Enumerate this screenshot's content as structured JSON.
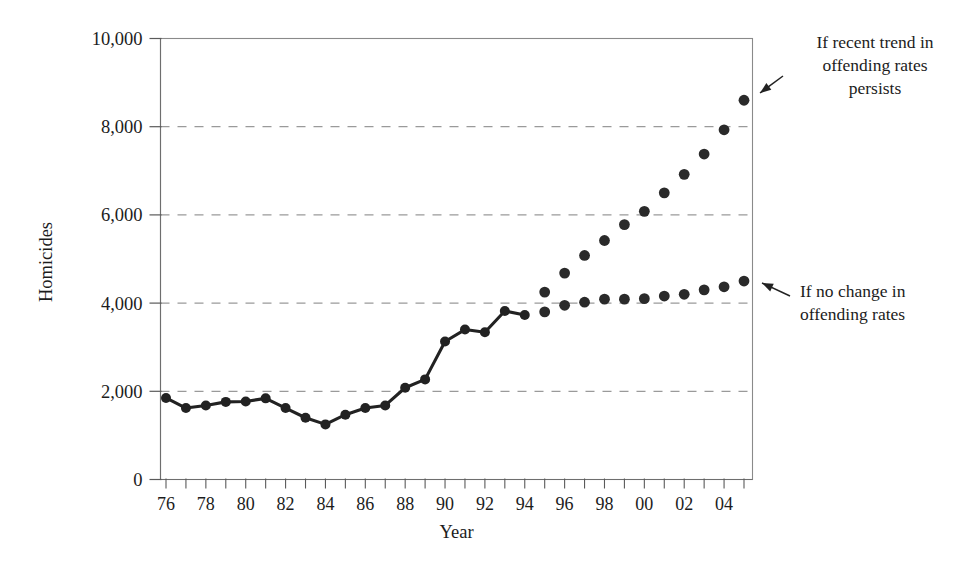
{
  "chart_data": {
    "type": "scatter",
    "title": "",
    "xlabel": "Year",
    "ylabel": "Homicides",
    "xlim": [
      1976,
      2005
    ],
    "ylim": [
      0,
      10000
    ],
    "grid": true,
    "legend_position": "none",
    "y_ticks": [
      0,
      2000,
      4000,
      6000,
      8000,
      10000
    ],
    "y_tick_labels": [
      "0",
      "2,000",
      "4,000",
      "6,000",
      "8,000",
      "10,000"
    ],
    "x_ticks": [
      1976,
      1977,
      1978,
      1979,
      1980,
      1981,
      1982,
      1983,
      1984,
      1985,
      1986,
      1987,
      1988,
      1989,
      1990,
      1991,
      1992,
      1993,
      1994,
      1995,
      1996,
      1997,
      1998,
      1999,
      2000,
      2001,
      2002,
      2003,
      2004,
      2005
    ],
    "x_tick_labels": [
      "76",
      "",
      "78",
      "",
      "80",
      "",
      "82",
      "",
      "84",
      "",
      "86",
      "",
      "88",
      "",
      "90",
      "",
      "92",
      "",
      "94",
      "",
      "96",
      "",
      "98",
      "",
      "00",
      "",
      "02",
      "",
      "04",
      ""
    ],
    "series": [
      {
        "name": "Historical homicides",
        "style": "line-with-markers",
        "x": [
          1976,
          1977,
          1978,
          1979,
          1980,
          1981,
          1982,
          1983,
          1984,
          1985,
          1986,
          1987,
          1988,
          1989,
          1990,
          1991,
          1992,
          1993,
          1994
        ],
        "values": [
          1850,
          1620,
          1680,
          1760,
          1770,
          1840,
          1620,
          1400,
          1250,
          1470,
          1620,
          1680,
          2080,
          2270,
          3130,
          3400,
          3340,
          3820,
          3730
        ]
      },
      {
        "name": "If recent trend in offending rates persists",
        "style": "markers",
        "x": [
          1995,
          1996,
          1997,
          1998,
          1999,
          2000,
          2001,
          2002,
          2003,
          2004,
          2005
        ],
        "values": [
          4250,
          4680,
          5080,
          5420,
          5780,
          6080,
          6500,
          6920,
          7380,
          7930,
          8600
        ]
      },
      {
        "name": "If no change in offending rates",
        "style": "markers",
        "x": [
          1995,
          1996,
          1997,
          1998,
          1999,
          2000,
          2001,
          2002,
          2003,
          2004,
          2005
        ],
        "values": [
          3800,
          3950,
          4020,
          4090,
          4090,
          4100,
          4160,
          4200,
          4300,
          4370,
          4500
        ]
      }
    ],
    "annotations": [
      {
        "id": "trend-persists",
        "lines": [
          "If recent trend in",
          "offending rates",
          "persists"
        ],
        "target_x": 2005,
        "target_y": 8600
      },
      {
        "id": "no-change",
        "lines": [
          "If no change in",
          "offending rates"
        ],
        "target_x": 2005,
        "target_y": 4500
      }
    ]
  }
}
